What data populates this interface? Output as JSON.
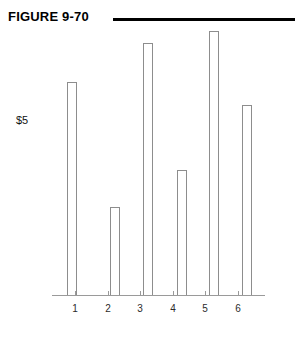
{
  "figure": {
    "title": "FIGURE 9-70"
  },
  "chart_data": {
    "type": "bar",
    "title": "FIGURE 9-70",
    "xlabel": "",
    "ylabel": "$5",
    "categories": [
      "1",
      "2",
      "3",
      "4",
      "5",
      "6"
    ],
    "values": [
      10.0,
      4.1,
      11.8,
      5.9,
      12.4,
      8.9
    ],
    "value_unit": "dollars",
    "ylim": [
      0,
      12.4
    ],
    "y_reference_label": "$5",
    "y_reference_value": 5,
    "grid": false,
    "legend": null,
    "axis_style": {
      "x_axis_line": true,
      "y_axis_line": false,
      "tick_marks": "x-only"
    },
    "bar_style": {
      "fill": "#ffffff",
      "stroke": "#8d8d8d"
    }
  },
  "colors": {
    "rule": "#000000",
    "axis": "#9a9a9a",
    "bar_stroke": "#8d8d8d",
    "bar_fill": "#ffffff",
    "text": "#000000",
    "background": "#ffffff"
  },
  "geometry": {
    "baseline_y": 295,
    "bar_width": 10,
    "bars": [
      {
        "category": "1",
        "left": 67,
        "top": 82
      },
      {
        "category": "2",
        "left": 110,
        "top": 207
      },
      {
        "category": "3",
        "left": 143,
        "top": 43
      },
      {
        "category": "4",
        "left": 177,
        "top": 170
      },
      {
        "category": "5",
        "left": 209,
        "top": 31
      },
      {
        "category": "6",
        "left": 242,
        "top": 105
      }
    ],
    "tick_centers": [
      75,
      108,
      140,
      173,
      205,
      238
    ]
  }
}
